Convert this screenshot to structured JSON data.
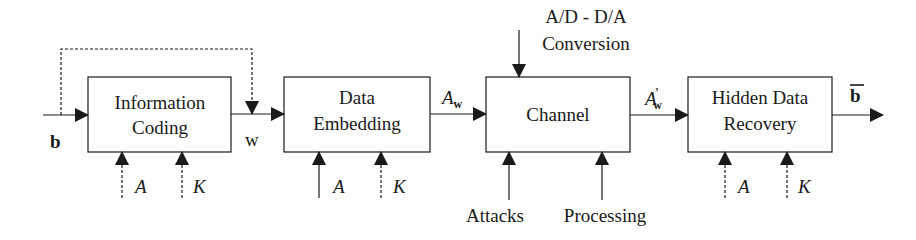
{
  "diagram": {
    "title": "",
    "colors": {
      "stroke": "#1a1a1a",
      "background": "#ffffff"
    },
    "blocks": [
      {
        "id": "information-coding",
        "line1": "Information",
        "line2": "Coding"
      },
      {
        "id": "data-embedding",
        "line1": "Data",
        "line2": "Embedding"
      },
      {
        "id": "channel",
        "line1": "Channel",
        "line2": ""
      },
      {
        "id": "hidden-data-recovery",
        "line1": "Hidden Data",
        "line2": "Recovery"
      }
    ],
    "signals": {
      "input": "b",
      "coded": "w",
      "watermarked": "A",
      "watermarked_sub": "w",
      "received": "A",
      "received_prime": "’",
      "received_sub": "w",
      "output": "b"
    },
    "side_inputs": {
      "information_coding": [
        {
          "label": "A",
          "style": "dashed"
        },
        {
          "label": "K",
          "style": "dashed"
        }
      ],
      "data_embedding": [
        {
          "label": "A",
          "style": "solid"
        },
        {
          "label": "K",
          "style": "dashed"
        }
      ],
      "channel_bottom": [
        {
          "label": "Attacks",
          "style": "solid"
        },
        {
          "label": "Processing",
          "style": "solid"
        }
      ],
      "channel_top": {
        "line1": "A/D - D/A",
        "line2": "Conversion",
        "style": "solid"
      },
      "hidden_data_recovery": [
        {
          "label": "A",
          "style": "dashed"
        },
        {
          "label": "K",
          "style": "dashed"
        }
      ]
    },
    "feedback": {
      "from": "b",
      "to": "w",
      "style": "dashed"
    }
  }
}
